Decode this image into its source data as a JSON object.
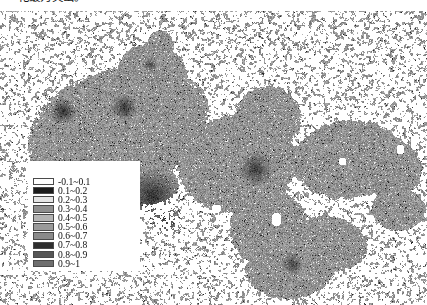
{
  "caption": {
    "text": "化最为突出。"
  },
  "figure": {
    "type": "classified-raster-map",
    "background_color": "#ffffff",
    "nodata_color": "#ffffff",
    "outline_color": "#ffffff"
  },
  "legend": {
    "items": [
      {
        "label": "-0.1~0.1",
        "color": "#ffffff",
        "value_min": -0.1,
        "value_max": 0.1
      },
      {
        "label": "0.1~0.2",
        "color": "#1c1c1c",
        "value_min": 0.1,
        "value_max": 0.2
      },
      {
        "label": "0.2~0.3",
        "color": "#e6e6e6",
        "value_min": 0.2,
        "value_max": 0.3
      },
      {
        "label": "0.3~0.4",
        "color": "#8f8f8f",
        "value_min": 0.3,
        "value_max": 0.4
      },
      {
        "label": "0.4~0.5",
        "color": "#b4b4b4",
        "value_min": 0.4,
        "value_max": 0.5
      },
      {
        "label": "0.5~0.6",
        "color": "#9a9a9a",
        "value_min": 0.5,
        "value_max": 0.6
      },
      {
        "label": "0.6~0.7",
        "color": "#8a8a8a",
        "value_min": 0.6,
        "value_max": 0.7
      },
      {
        "label": "0.7~0.8",
        "color": "#2e2e2e",
        "value_min": 0.7,
        "value_max": 0.8
      },
      {
        "label": "0.8~0.9",
        "color": "#565656",
        "value_min": 0.8,
        "value_max": 0.9
      },
      {
        "label": "0.9~1",
        "color": "#6e6e6e",
        "value_min": 0.9,
        "value_max": 1.0
      }
    ]
  },
  "map_render": {
    "seed": 20240517,
    "base_gray": 150,
    "grain_amplitude": 46,
    "speckle_dark": 70,
    "speckle_light": 228,
    "regions": [
      {
        "name": "northwest-lobe",
        "cx": 118,
        "cy": 118,
        "rx": 95,
        "ry": 62,
        "rot": -18
      },
      {
        "name": "north-spur",
        "cx": 152,
        "cy": 62,
        "rx": 36,
        "ry": 30,
        "rot": 10
      },
      {
        "name": "north-tip",
        "cx": 160,
        "cy": 36,
        "rx": 14,
        "ry": 18,
        "rot": 0
      },
      {
        "name": "west-tail",
        "cx": 70,
        "cy": 140,
        "rx": 44,
        "ry": 34,
        "rot": 25
      },
      {
        "name": "south-west-foot",
        "cx": 128,
        "cy": 168,
        "rx": 52,
        "ry": 26,
        "rot": 8
      },
      {
        "name": "central-block",
        "cx": 236,
        "cy": 152,
        "rx": 62,
        "ry": 50,
        "rot": -5
      },
      {
        "name": "central-north-block",
        "cx": 268,
        "cy": 106,
        "rx": 34,
        "ry": 32,
        "rot": 0
      },
      {
        "name": "east-block",
        "cx": 348,
        "cy": 148,
        "rx": 58,
        "ry": 40,
        "rot": -6
      },
      {
        "name": "east-lobe",
        "cx": 392,
        "cy": 158,
        "rx": 30,
        "ry": 30,
        "rot": 0
      },
      {
        "name": "south-central-peninsula",
        "cx": 268,
        "cy": 216,
        "rx": 40,
        "ry": 40,
        "rot": 0
      },
      {
        "name": "south-foot",
        "cx": 290,
        "cy": 256,
        "rx": 46,
        "ry": 32,
        "rot": -4
      },
      {
        "name": "southeast-arm",
        "cx": 330,
        "cy": 232,
        "rx": 38,
        "ry": 28,
        "rot": 12
      },
      {
        "name": "east-strip",
        "cx": 398,
        "cy": 198,
        "rx": 28,
        "ry": 22,
        "rot": 0
      }
    ],
    "dark_cores": [
      {
        "name": "urban-core-northwest",
        "cx": 63,
        "cy": 100,
        "r": 7,
        "strength": 0.95
      },
      {
        "name": "urban-core-north",
        "cx": 124,
        "cy": 96,
        "r": 7,
        "strength": 0.95
      },
      {
        "name": "urban-core-central",
        "cx": 152,
        "cy": 185,
        "r": 15,
        "strength": 1.0
      },
      {
        "name": "urban-core-midsouth",
        "cx": 166,
        "cy": 210,
        "r": 9,
        "strength": 0.9
      },
      {
        "name": "urban-core-east",
        "cx": 255,
        "cy": 158,
        "r": 9,
        "strength": 0.9
      },
      {
        "name": "urban-core-southeast",
        "cx": 292,
        "cy": 253,
        "r": 6,
        "strength": 0.8
      },
      {
        "name": "urban-core-northspur",
        "cx": 150,
        "cy": 53,
        "r": 4,
        "strength": 0.7
      }
    ],
    "water_holes": [
      {
        "name": "lake-a",
        "cx": 196,
        "cy": 196,
        "rx": 5,
        "ry": 4
      },
      {
        "name": "lake-b",
        "cx": 216,
        "cy": 197,
        "rx": 5,
        "ry": 4
      },
      {
        "name": "lake-c",
        "cx": 276,
        "cy": 208,
        "rx": 5,
        "ry": 7
      },
      {
        "name": "lake-d",
        "cx": 342,
        "cy": 150,
        "rx": 4,
        "ry": 4
      },
      {
        "name": "lake-e",
        "cx": 180,
        "cy": 225,
        "rx": 4,
        "ry": 3
      },
      {
        "name": "lake-f",
        "cx": 400,
        "cy": 138,
        "rx": 4,
        "ry": 5
      }
    ]
  }
}
